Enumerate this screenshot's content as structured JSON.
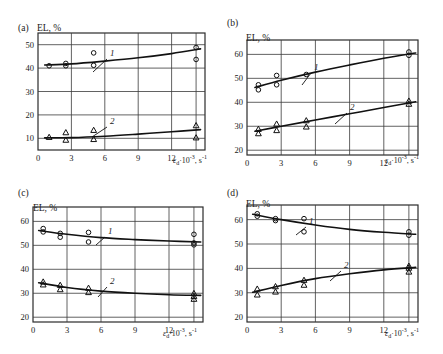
{
  "figure": {
    "axis_label_y": "EL, %",
    "axis_label_x_eps": "ε",
    "axis_label_x_sub": "d",
    "axis_label_x_mid": "·10",
    "axis_label_x_sup": "-3",
    "axis_label_x_tail": ", s",
    "axis_label_x_tail_sup": "-1",
    "axis_label_x_full": "εd·10-3, s-1",
    "curve_label_1": "1",
    "curve_label_2": "2"
  },
  "panels": [
    {
      "id": "a",
      "tag": "(a)",
      "ylabel": "EL, %",
      "xticks": [
        "0",
        "3",
        "6",
        "9",
        "12"
      ],
      "yticks": [
        "10",
        "20",
        "30",
        "40",
        "50"
      ]
    },
    {
      "id": "b",
      "tag": "(b)",
      "ylabel": "EL, %",
      "xticks": [
        "0",
        "3",
        "6",
        "9",
        "12"
      ],
      "yticks": [
        "20",
        "30",
        "40",
        "50",
        "60"
      ]
    },
    {
      "id": "c",
      "tag": "(c)",
      "ylabel": "EL, %",
      "xticks": [
        "0",
        "3",
        "6",
        "9",
        "12"
      ],
      "yticks": [
        "20",
        "30",
        "40",
        "50",
        "60"
      ]
    },
    {
      "id": "d",
      "tag": "(d)",
      "ylabel": "EL, %",
      "xticks": [
        "0",
        "3",
        "6",
        "9",
        "12"
      ],
      "yticks": [
        "20",
        "30",
        "40",
        "50",
        "60"
      ]
    }
  ],
  "chart_data": [
    {
      "type": "scatter",
      "panel": "a",
      "title": "(a)",
      "xlabel": "εd·10-3, s-1",
      "ylabel": "EL, %",
      "xlim": [
        0,
        15
      ],
      "ylim": [
        5,
        55
      ],
      "xticks": [
        0,
        3,
        6,
        9,
        12
      ],
      "yticks": [
        10,
        20,
        30,
        40,
        50
      ],
      "grid": true,
      "legend": "inline-curve-numbers",
      "series": [
        {
          "name": "1",
          "marker": "circle",
          "points": [
            {
              "x": 1.0,
              "y": 41.0
            },
            {
              "x": 2.5,
              "y": 42.0
            },
            {
              "x": 2.5,
              "y": 41.0
            },
            {
              "x": 5.0,
              "y": 46.5
            },
            {
              "x": 5.0,
              "y": 41.2
            },
            {
              "x": 14.2,
              "y": 48.8
            },
            {
              "x": 14.2,
              "y": 43.7
            }
          ],
          "fit_curve": [
            {
              "x": 0.6,
              "y": 41.3
            },
            {
              "x": 3.0,
              "y": 41.8
            },
            {
              "x": 6.0,
              "y": 43.0
            },
            {
              "x": 9.0,
              "y": 44.4
            },
            {
              "x": 12.0,
              "y": 46.2
            },
            {
              "x": 14.6,
              "y": 48.2
            }
          ]
        },
        {
          "name": "2",
          "marker": "triangle",
          "points": [
            {
              "x": 1.0,
              "y": 10.5
            },
            {
              "x": 2.5,
              "y": 12.5
            },
            {
              "x": 2.5,
              "y": 9.3
            },
            {
              "x": 5.0,
              "y": 13.5
            },
            {
              "x": 5.0,
              "y": 9.6
            },
            {
              "x": 14.2,
              "y": 15.5
            },
            {
              "x": 14.2,
              "y": 10.3
            }
          ],
          "fit_curve": [
            {
              "x": 0.6,
              "y": 10.2
            },
            {
              "x": 3.0,
              "y": 10.3
            },
            {
              "x": 6.0,
              "y": 10.9
            },
            {
              "x": 9.0,
              "y": 11.8
            },
            {
              "x": 12.0,
              "y": 12.8
            },
            {
              "x": 14.6,
              "y": 13.7
            }
          ]
        }
      ]
    },
    {
      "type": "scatter",
      "panel": "b",
      "title": "(b)",
      "xlabel": "εd·10-3, s-1",
      "ylabel": "EL, %",
      "xlim": [
        0,
        15
      ],
      "ylim": [
        18,
        66
      ],
      "xticks": [
        0,
        3,
        6,
        9,
        12
      ],
      "yticks": [
        20,
        30,
        40,
        50,
        60
      ],
      "grid": true,
      "legend": "inline-curve-numbers",
      "series": [
        {
          "name": "1",
          "marker": "circle",
          "points": [
            {
              "x": 1.0,
              "y": 47.3
            },
            {
              "x": 1.0,
              "y": 45.2
            },
            {
              "x": 2.6,
              "y": 51.2
            },
            {
              "x": 2.6,
              "y": 47.3
            },
            {
              "x": 5.2,
              "y": 51.6
            },
            {
              "x": 14.2,
              "y": 61.0
            },
            {
              "x": 14.2,
              "y": 59.6
            }
          ],
          "fit_curve": [
            {
              "x": 0.7,
              "y": 46.2
            },
            {
              "x": 3.0,
              "y": 49.2
            },
            {
              "x": 6.0,
              "y": 52.6
            },
            {
              "x": 9.0,
              "y": 55.6
            },
            {
              "x": 12.0,
              "y": 58.4
            },
            {
              "x": 14.8,
              "y": 60.6
            }
          ]
        },
        {
          "name": "2",
          "marker": "triangle",
          "points": [
            {
              "x": 1.0,
              "y": 28.8
            },
            {
              "x": 1.0,
              "y": 27.0
            },
            {
              "x": 2.6,
              "y": 31.0
            },
            {
              "x": 2.6,
              "y": 28.3
            },
            {
              "x": 5.2,
              "y": 32.4
            },
            {
              "x": 5.2,
              "y": 29.8
            },
            {
              "x": 14.2,
              "y": 40.6
            },
            {
              "x": 14.2,
              "y": 39.3
            }
          ],
          "fit_curve": [
            {
              "x": 0.7,
              "y": 27.9
            },
            {
              "x": 3.0,
              "y": 30.0
            },
            {
              "x": 6.0,
              "y": 32.6
            },
            {
              "x": 9.0,
              "y": 35.2
            },
            {
              "x": 12.0,
              "y": 37.8
            },
            {
              "x": 14.8,
              "y": 40.2
            }
          ]
        }
      ]
    },
    {
      "type": "scatter",
      "panel": "c",
      "title": "(c)",
      "xlabel": "εd·10-3, s-1",
      "ylabel": "EL, %",
      "xlim": [
        0,
        15
      ],
      "ylim": [
        18,
        66
      ],
      "xticks": [
        0,
        3,
        6,
        9,
        12
      ],
      "yticks": [
        20,
        30,
        40,
        50,
        60
      ],
      "grid": true,
      "legend": "inline-curve-numbers",
      "series": [
        {
          "name": "1",
          "marker": "circle",
          "points": [
            {
              "x": 0.9,
              "y": 57.0
            },
            {
              "x": 0.9,
              "y": 55.6
            },
            {
              "x": 2.4,
              "y": 55.0
            },
            {
              "x": 2.4,
              "y": 53.4
            },
            {
              "x": 4.9,
              "y": 55.4
            },
            {
              "x": 4.9,
              "y": 51.4
            },
            {
              "x": 14.2,
              "y": 54.6
            },
            {
              "x": 14.2,
              "y": 51.0
            },
            {
              "x": 14.2,
              "y": 50.2
            }
          ],
          "fit_curve": [
            {
              "x": 0.5,
              "y": 56.2
            },
            {
              "x": 3.0,
              "y": 54.6
            },
            {
              "x": 6.0,
              "y": 53.2
            },
            {
              "x": 9.0,
              "y": 52.4
            },
            {
              "x": 12.0,
              "y": 51.8
            },
            {
              "x": 14.8,
              "y": 51.4
            }
          ]
        },
        {
          "name": "2",
          "marker": "triangle",
          "points": [
            {
              "x": 0.9,
              "y": 34.8
            },
            {
              "x": 0.9,
              "y": 33.6
            },
            {
              "x": 2.4,
              "y": 33.4
            },
            {
              "x": 2.4,
              "y": 31.6
            },
            {
              "x": 4.9,
              "y": 32.2
            },
            {
              "x": 4.9,
              "y": 30.4
            },
            {
              "x": 14.2,
              "y": 30.0
            },
            {
              "x": 14.2,
              "y": 28.8
            },
            {
              "x": 14.2,
              "y": 27.6
            }
          ],
          "fit_curve": [
            {
              "x": 0.5,
              "y": 34.4
            },
            {
              "x": 3.0,
              "y": 32.4
            },
            {
              "x": 6.0,
              "y": 30.9
            },
            {
              "x": 9.0,
              "y": 30.0
            },
            {
              "x": 12.0,
              "y": 29.4
            },
            {
              "x": 14.8,
              "y": 29.1
            }
          ]
        }
      ]
    },
    {
      "type": "scatter",
      "panel": "d",
      "title": "(d)",
      "xlabel": "εd·10-3, s-1",
      "ylabel": "EL, %",
      "xlim": [
        0,
        15
      ],
      "ylim": [
        18,
        66
      ],
      "xticks": [
        0,
        3,
        6,
        9,
        12
      ],
      "yticks": [
        20,
        30,
        40,
        50,
        60
      ],
      "grid": true,
      "legend": "inline-curve-numbers",
      "series": [
        {
          "name": "1",
          "marker": "circle",
          "points": [
            {
              "x": 0.9,
              "y": 62.4
            },
            {
              "x": 0.9,
              "y": 61.4
            },
            {
              "x": 2.5,
              "y": 60.4
            },
            {
              "x": 2.5,
              "y": 59.6
            },
            {
              "x": 5.0,
              "y": 60.4
            },
            {
              "x": 5.0,
              "y": 55.0
            },
            {
              "x": 14.2,
              "y": 55.0
            },
            {
              "x": 14.2,
              "y": 53.6
            }
          ],
          "fit_curve": [
            {
              "x": 0.5,
              "y": 62.2
            },
            {
              "x": 3.0,
              "y": 60.0
            },
            {
              "x": 6.0,
              "y": 57.8
            },
            {
              "x": 9.0,
              "y": 56.0
            },
            {
              "x": 12.0,
              "y": 54.8
            },
            {
              "x": 14.8,
              "y": 54.0
            }
          ]
        },
        {
          "name": "2",
          "marker": "triangle",
          "points": [
            {
              "x": 0.9,
              "y": 31.6
            },
            {
              "x": 0.9,
              "y": 29.2
            },
            {
              "x": 2.5,
              "y": 32.6
            },
            {
              "x": 2.5,
              "y": 30.4
            },
            {
              "x": 5.0,
              "y": 35.2
            },
            {
              "x": 5.0,
              "y": 33.2
            },
            {
              "x": 14.2,
              "y": 41.0
            },
            {
              "x": 14.2,
              "y": 40.2
            },
            {
              "x": 14.2,
              "y": 38.6
            }
          ],
          "fit_curve": [
            {
              "x": 0.5,
              "y": 30.2
            },
            {
              "x": 3.0,
              "y": 33.0
            },
            {
              "x": 6.0,
              "y": 35.8
            },
            {
              "x": 9.0,
              "y": 37.8
            },
            {
              "x": 12.0,
              "y": 39.4
            },
            {
              "x": 14.8,
              "y": 40.4
            }
          ]
        }
      ]
    }
  ]
}
